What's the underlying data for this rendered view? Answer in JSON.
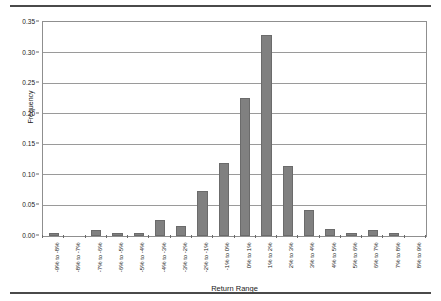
{
  "chart_data": {
    "type": "bar",
    "title": "",
    "xlabel": "Return Range",
    "ylabel": "Frequency",
    "ylim": [
      0,
      0.35
    ],
    "grid": true,
    "legend": "none",
    "yticks": [
      "0.00",
      "0.05",
      "0.10",
      "0.15",
      "0.20",
      "0.25",
      "0.30",
      "0.35"
    ],
    "ytick_values": [
      0,
      0.05,
      0.1,
      0.15,
      0.2,
      0.25,
      0.3,
      0.35
    ],
    "categories": [
      "-9% to -8%",
      "-8% to -7%",
      "-7% to -6%",
      "-6% to -5%",
      "-5% to -4%",
      "-4% to -3%",
      "-3% to -2%",
      "-2% to -1%",
      "-1% to 0%",
      "0% to 1%",
      "1% to 2%",
      "2% to 3%",
      "3% to 4%",
      "4% to 5%",
      "5% to 6%",
      "6% to 7%",
      "7% to 8%",
      "8% to 9%"
    ],
    "values": [
      0.005,
      0.0,
      0.01,
      0.005,
      0.005,
      0.027,
      0.016,
      0.073,
      0.12,
      0.225,
      0.328,
      0.115,
      0.042,
      0.011,
      0.005,
      0.01,
      0.005,
      0.0
    ],
    "colors": {
      "bar_fill": "#808080",
      "bar_edge": "#6b6b6b",
      "gridline": "#9a9a9a",
      "axis": "#8f8f8f",
      "plot_background": "#ffffff",
      "text": "#1a1a1a",
      "rule": "#4a4a4a"
    }
  }
}
